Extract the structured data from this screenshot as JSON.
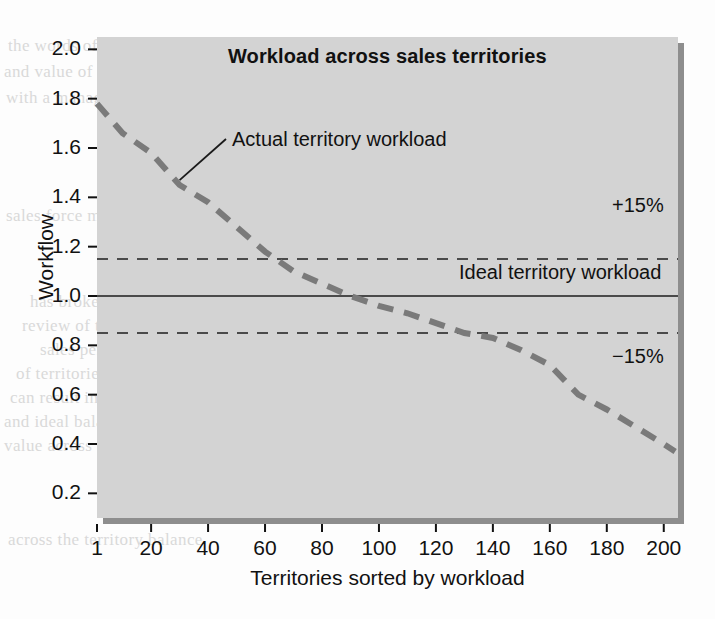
{
  "chart_data": {
    "type": "line",
    "title": "Workload across sales territories",
    "xlabel": "Territories sorted by workload",
    "ylabel": "Workflow",
    "xlim": [
      1,
      205
    ],
    "ylim": [
      0.1,
      2.05
    ],
    "grid": false,
    "legend_position": "inline-annotations",
    "xticks": [
      "1",
      "20",
      "40",
      "60",
      "80",
      "100",
      "120",
      "140",
      "160",
      "180",
      "200"
    ],
    "xtick_values": [
      1,
      20,
      40,
      60,
      80,
      100,
      120,
      140,
      160,
      180,
      200
    ],
    "yticks": [
      "0.2",
      "0.4",
      "0.6",
      "0.8",
      "1.0",
      "1.2",
      "1.4",
      "1.6",
      "1.8",
      "2.0"
    ],
    "ytick_values": [
      0.2,
      0.4,
      0.6,
      0.8,
      1.0,
      1.2,
      1.4,
      1.6,
      1.8,
      2.0
    ],
    "series": [
      {
        "name": "Actual territory workload",
        "style": "dashed",
        "color": "#7a7a7a",
        "x": [
          1,
          10,
          20,
          30,
          40,
          50,
          60,
          70,
          80,
          90,
          95,
          100,
          110,
          120,
          130,
          140,
          150,
          160,
          165,
          170,
          180,
          190,
          200,
          204
        ],
        "values": [
          1.78,
          1.66,
          1.58,
          1.45,
          1.38,
          1.28,
          1.18,
          1.1,
          1.05,
          1.0,
          0.98,
          0.96,
          0.93,
          0.89,
          0.85,
          0.83,
          0.78,
          0.72,
          0.66,
          0.6,
          0.54,
          0.47,
          0.4,
          0.37
        ]
      }
    ],
    "reference_lines": [
      {
        "name": "Ideal territory workload",
        "value": 1.0,
        "style": "solid",
        "color": "#4a4a4a",
        "label": "Ideal territory workload"
      },
      {
        "name": "upper-tolerance",
        "value": 1.15,
        "style": "dashed",
        "color": "#4a4a4a",
        "label": "+15%"
      },
      {
        "name": "lower-tolerance",
        "value": 0.85,
        "style": "dashed",
        "color": "#4a4a4a",
        "label": "−15%"
      }
    ],
    "annotations": [
      {
        "name": "actual-workload-callout",
        "text": "Actual territory workload",
        "points_to_x": 30,
        "points_to_y": 1.47
      }
    ],
    "colors": {
      "plot_background": "#d3d3d3",
      "plot_shadow": "#8e8e8e",
      "series": "#7a7a7a",
      "reference": "#4a4a4a",
      "text": "#111111"
    }
  },
  "bleed_text": {
    "lines": [
      "the words of the page behind show through the paper",
      "and value of a territory is reviewed",
      "with a manager so that the workload of each territory",
      "in balance and the",
      "sales force management analysis",
      "has broken the workload and the",
      "review of their performance and",
      "sales performance then new risk of the",
      "of territories are reviewed and the",
      "can result in overtime and reduced",
      "and ideal balance of each territory the benefit",
      "value across the workload of the territory the",
      "across the territory balance"
    ]
  }
}
